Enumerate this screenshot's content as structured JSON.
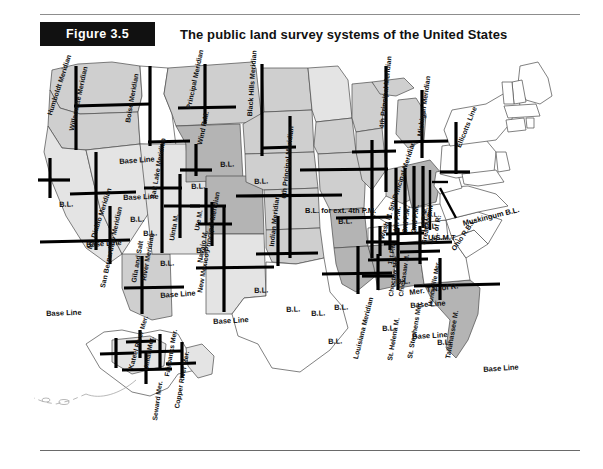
{
  "figure": {
    "tag": "Figure 3.5",
    "title": "The public land survey systems of the United States"
  },
  "colors": {
    "tag_background": "#111111",
    "tag_text": "#ffffff",
    "title_text": "#111111",
    "rule": "#8d8d8d",
    "survey_line": "#000000",
    "state_outline": "#4a4a4a",
    "shade_dark": "#b4b4b4",
    "shade_mid": "#cfcfcf",
    "shade_light": "#e4e4e4",
    "unsurveyed": "#ffffff"
  },
  "map": {
    "region_name": "United States public land survey systems",
    "insets": [
      "Alaska"
    ],
    "unsurveyed_regions": [
      "Texas",
      "New England",
      "Mid-Atlantic",
      "Southeast Atlantic states",
      "Kentucky",
      "Tennessee",
      "West Virginia"
    ]
  },
  "labels": [
    {
      "id": "humboldt-meridian",
      "text": "Humboldt Meridian",
      "x": 46,
      "y": 66,
      "rot": -72,
      "size": 7.0
    },
    {
      "id": "willamette-meridian",
      "text": "Willamette Meridian",
      "x": 68,
      "y": 82,
      "rot": -78,
      "size": 7.0
    },
    {
      "id": "mt-diablo-meridian",
      "text": "Mt. Diablo Meridian",
      "x": 86,
      "y": 200,
      "rot": -72,
      "size": 7.0
    },
    {
      "id": "boise-meridian",
      "text": "Boise Meridian",
      "x": 124,
      "y": 74,
      "rot": -80,
      "size": 7.0
    },
    {
      "id": "principal-meridian-mt",
      "text": "Principal Meridian",
      "x": 185,
      "y": 60,
      "rot": -78,
      "size": 7.0
    },
    {
      "id": "wind-rm",
      "text": "Wind R.M.",
      "x": 196,
      "y": 96,
      "rot": -78,
      "size": 7.0
    },
    {
      "id": "black-hills-meridian",
      "text": "Black Hills Meridian",
      "x": 246,
      "y": 68,
      "rot": -86,
      "size": 7.0
    },
    {
      "id": "salt-lake-meridian",
      "text": "Salt Lake Meridian",
      "x": 149,
      "y": 150,
      "rot": -80,
      "size": 7.0
    },
    {
      "id": "uinta-m",
      "text": "Uinta M.",
      "x": 168,
      "y": 192,
      "rot": -80,
      "size": 7.0
    },
    {
      "id": "ute-m",
      "text": "Ute M.",
      "x": 193,
      "y": 182,
      "rot": -80,
      "size": 7.0
    },
    {
      "id": "navajo-m",
      "text": "Navajo M.",
      "x": 196,
      "y": 214,
      "rot": -80,
      "size": 7.0
    },
    {
      "id": "san-bernardino-meridian",
      "text": "San Bernardino Meridian",
      "x": 99,
      "y": 239,
      "rot": -78,
      "size": 7.0
    },
    {
      "id": "gila-salt-river-1",
      "text": "Gila and Salt",
      "x": 130,
      "y": 234,
      "rot": -80,
      "size": 7.0
    },
    {
      "id": "gila-salt-river-2",
      "text": "River Meridian",
      "x": 140,
      "y": 232,
      "rot": -80,
      "size": 7.0
    },
    {
      "id": "new-mexico-principal",
      "text": "New Mexico Principal Meridian",
      "x": 196,
      "y": 244,
      "rot": -80,
      "size": 7.0
    },
    {
      "id": "indian-meridian",
      "text": "Indian Meridian",
      "x": 268,
      "y": 198,
      "rot": -84,
      "size": 7.0
    },
    {
      "id": "sixth-principal-meridian",
      "text": "6th Principal Meridian",
      "x": 280,
      "y": 150,
      "rot": -84,
      "size": 7.0
    },
    {
      "id": "fourth-principal-meridian",
      "text": "4th Principal Meridian",
      "x": 378,
      "y": 80,
      "rot": -84,
      "size": 7.0
    },
    {
      "id": "fifth-principal-meridian",
      "text": "Wash M. 5th Principal Meridian",
      "x": 378,
      "y": 190,
      "rot": -72,
      "size": 7.0
    },
    {
      "id": "michigan-meridian",
      "text": "Michigan Meridian",
      "x": 416,
      "y": 88,
      "rot": -82,
      "size": 7.0
    },
    {
      "id": "ellicotts-line",
      "text": "Ellicotts Line",
      "x": 455,
      "y": 98,
      "rot": -68,
      "size": 7.0
    },
    {
      "id": "muskingum-bl",
      "text": "Muskingum B.L.",
      "x": 462,
      "y": 172,
      "rot": -14,
      "size": 7.5
    },
    {
      "id": "usmt",
      "text": "U.S.M.T.",
      "x": 428,
      "y": 186,
      "rot": 0,
      "size": 7.5
    },
    {
      "id": "great-miami",
      "text": "Great Miami",
      "x": 420,
      "y": 196,
      "rot": -80,
      "size": 7.0
    },
    {
      "id": "te-of-r",
      "text": "T.E. of R.",
      "x": 430,
      "y": 196,
      "rot": -80,
      "size": 7.0
    },
    {
      "id": "ohio-rbl",
      "text": "Ohio R.B.L.",
      "x": 450,
      "y": 200,
      "rot": -56,
      "size": 7.0
    },
    {
      "id": "fourth-pm",
      "text": "4th P.M.",
      "x": 392,
      "y": 184,
      "rot": -84,
      "size": 7.0
    },
    {
      "id": "third-pm",
      "text": "3rd P.M.",
      "x": 401,
      "y": 184,
      "rot": -84,
      "size": 7.0
    },
    {
      "id": "second-pm",
      "text": "2nd P.M.",
      "x": 410,
      "y": 184,
      "rot": -84,
      "size": 7.0
    },
    {
      "id": "first-pm",
      "text": "1st P.M.",
      "x": 419,
      "y": 184,
      "rot": -84,
      "size": 7.0
    },
    {
      "id": "first-pm-lower",
      "text": "1st P.M.",
      "x": 387,
      "y": 216,
      "rot": -80,
      "size": 6.5
    },
    {
      "id": "mer-tn-of-r",
      "text": "Mer. T.N. of R.",
      "x": 409,
      "y": 241,
      "rot": -8,
      "size": 7.5
    },
    {
      "id": "bl-ext-4th-pm",
      "text": "B.L. for ext. 4th P.M.",
      "x": 305,
      "y": 159,
      "rot": 0,
      "size": 7.5
    },
    {
      "id": "louisiana-meridian",
      "text": "Louisiana Meridian",
      "x": 352,
      "y": 310,
      "rot": -76,
      "size": 7.0
    },
    {
      "id": "st-helena-m",
      "text": "St. Helena M.",
      "x": 386,
      "y": 312,
      "rot": -80,
      "size": 7.0
    },
    {
      "id": "st-stephens-mer",
      "text": "St. Stephens Mer.",
      "x": 406,
      "y": 310,
      "rot": -80,
      "size": 7.0
    },
    {
      "id": "tallahassee-m",
      "text": "Tallahassee M.",
      "x": 444,
      "y": 310,
      "rot": -80,
      "size": 7.0
    },
    {
      "id": "choctaw-mer",
      "text": "Choctaw Mer.",
      "x": 388,
      "y": 248,
      "rot": -82,
      "size": 6.5
    },
    {
      "id": "chickasaw-m",
      "text": "Chickasaw M.",
      "x": 398,
      "y": 248,
      "rot": -82,
      "size": 6.5
    },
    {
      "id": "huntsville-mer",
      "text": "Huntsville Mer.",
      "x": 427,
      "y": 258,
      "rot": -80,
      "size": 6.5
    },
    {
      "id": "kateel-river-mer",
      "text": "Kateel River Mer.",
      "x": 128,
      "y": 320,
      "rot": -74,
      "size": 6.8
    },
    {
      "id": "umiat-mer",
      "text": "Umiat Mer.",
      "x": 143,
      "y": 322,
      "rot": -80,
      "size": 6.8
    },
    {
      "id": "fairbanks-mer",
      "text": "Fairbanks Mer.",
      "x": 164,
      "y": 328,
      "rot": -80,
      "size": 6.8
    },
    {
      "id": "seward-mer",
      "text": "Seward Mer.",
      "x": 152,
      "y": 372,
      "rot": -82,
      "size": 6.8
    },
    {
      "id": "copper-river-mer",
      "text": "Copper River Mer.",
      "x": 174,
      "y": 360,
      "rot": -80,
      "size": 6.8
    },
    {
      "id": "base-line-or",
      "text": "Base Line",
      "x": 119,
      "y": 110,
      "rot": -4,
      "size": 7.5
    },
    {
      "id": "base-line-id",
      "text": "Base Line",
      "x": 123,
      "y": 146,
      "rot": -2,
      "size": 7.5
    },
    {
      "id": "base-line-ca",
      "text": "Base Line",
      "x": 86,
      "y": 193,
      "rot": -3,
      "size": 7.5
    },
    {
      "id": "base-line-sb",
      "text": "Base Line",
      "x": 46,
      "y": 262,
      "rot": -2,
      "size": 7.5
    },
    {
      "id": "base-line-gila",
      "text": "Base Line",
      "x": 160,
      "y": 244,
      "rot": -4,
      "size": 7.5
    },
    {
      "id": "base-line-nm",
      "text": "Base Line",
      "x": 213,
      "y": 270,
      "rot": -3,
      "size": 7.5
    },
    {
      "id": "base-line-ms",
      "text": "Base Line",
      "x": 410,
      "y": 254,
      "rot": -4,
      "size": 7.5
    },
    {
      "id": "base-line-al",
      "text": "Base Line",
      "x": 412,
      "y": 285,
      "rot": -3,
      "size": 7.5
    },
    {
      "id": "base-line-fl",
      "text": "Base Line",
      "x": 483,
      "y": 318,
      "rot": -4,
      "size": 7.5
    },
    {
      "id": "bl-nv",
      "text": "B.L.",
      "x": 59,
      "y": 153,
      "rot": -2,
      "size": 7.5
    },
    {
      "id": "bl-ut",
      "text": "B.L.",
      "x": 143,
      "y": 182,
      "rot": -2,
      "size": 7.5
    },
    {
      "id": "bl-nv2",
      "text": "B.L.",
      "x": 130,
      "y": 168,
      "rot": -2,
      "size": 7.5
    },
    {
      "id": "bl-co",
      "text": "B.L.",
      "x": 196,
      "y": 199,
      "rot": -2,
      "size": 7.5
    },
    {
      "id": "bl-az",
      "text": "B.L.",
      "x": 160,
      "y": 212,
      "rot": -2,
      "size": 7.5
    },
    {
      "id": "bl-wy",
      "text": "B.L.",
      "x": 191,
      "y": 135,
      "rot": -2,
      "size": 7.5
    },
    {
      "id": "bl-mt",
      "text": "B.L.",
      "x": 220,
      "y": 113,
      "rot": -2,
      "size": 7.5
    },
    {
      "id": "bl-sd",
      "text": "B.L.",
      "x": 254,
      "y": 130,
      "rot": -2,
      "size": 7.5
    },
    {
      "id": "bl-ks",
      "text": "B.L.",
      "x": 254,
      "y": 239,
      "rot": -2,
      "size": 7.5
    },
    {
      "id": "bl-ok",
      "text": "B.L.",
      "x": 286,
      "y": 258,
      "rot": -2,
      "size": 7.5
    },
    {
      "id": "bl-ok2",
      "text": "B.L.",
      "x": 311,
      "y": 262,
      "rot": -2,
      "size": 7.5
    },
    {
      "id": "bl-tx",
      "text": "B.L.",
      "x": 328,
      "y": 290,
      "rot": -2,
      "size": 7.5
    },
    {
      "id": "bl-il",
      "text": "B.L.",
      "x": 338,
      "y": 170,
      "rot": -2,
      "size": 7.5
    },
    {
      "id": "bl-ar",
      "text": "B.L.",
      "x": 334,
      "y": 256,
      "rot": -2,
      "size": 7.5
    },
    {
      "id": "bl-in",
      "text": "B.L.",
      "x": 396,
      "y": 230,
      "rot": -2,
      "size": 7.5
    },
    {
      "id": "bl-mi",
      "text": "B.L.",
      "x": 424,
      "y": 175,
      "rot": -2,
      "size": 7.5
    },
    {
      "id": "bl-la",
      "text": "B.L.",
      "x": 382,
      "y": 277,
      "rot": -2,
      "size": 7.5
    },
    {
      "id": "bl-ga",
      "text": "B.L.",
      "x": 437,
      "y": 291,
      "rot": -2,
      "size": 7.5
    },
    {
      "id": "bl-mi2",
      "text": "B.L.",
      "x": 427,
      "y": 164,
      "rot": -2,
      "size": 6.5
    }
  ]
}
